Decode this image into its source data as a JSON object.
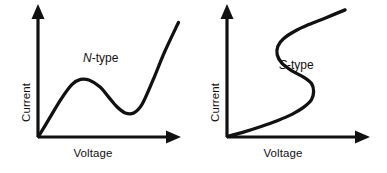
{
  "figure": {
    "background_color": "#ffffff",
    "ink_color": "#111111",
    "panel_count": 2
  },
  "chart_data": [
    {
      "type": "line",
      "title": "",
      "annotation": "N-type",
      "annotation_symbol": "N",
      "annotation_suffix": "-type",
      "xlabel": "Voltage",
      "ylabel": "Current",
      "grid": false,
      "legend": "none",
      "axis_style": "arrow-headed half-axes, no tick marks, no numeric scale",
      "xlim": [
        0,
        1
      ],
      "ylim": [
        0,
        1
      ],
      "description": "N-shaped current-voltage characteristic: current rises to a local peak, falls to a local valley (negative differential resistance region), then rises steeply. Current is a single-valued function of voltage.",
      "x": [
        0.0,
        0.08,
        0.16,
        0.24,
        0.3,
        0.36,
        0.44,
        0.5,
        0.56,
        0.62,
        0.68,
        0.74,
        0.82,
        0.9,
        1.0
      ],
      "y": [
        0.0,
        0.15,
        0.3,
        0.42,
        0.46,
        0.455,
        0.4,
        0.32,
        0.24,
        0.19,
        0.19,
        0.26,
        0.46,
        0.68,
        0.92
      ],
      "features": {
        "peak_point": {
          "x": 0.32,
          "y": 0.46
        },
        "valley_point": {
          "x": 0.65,
          "y": 0.185
        },
        "ndr_region": "between peak and valley"
      }
    },
    {
      "type": "line",
      "title": "",
      "annotation": "S-type",
      "annotation_symbol": "S",
      "annotation_suffix": "-type",
      "xlabel": "Voltage",
      "ylabel": "Current",
      "grid": false,
      "legend": "none",
      "axis_style": "arrow-headed half-axes, no tick marks, no numeric scale",
      "xlim": [
        0,
        1
      ],
      "ylim": [
        0,
        1
      ],
      "description": "S-shaped current-voltage characteristic: voltage rises to a local maximum, folds back to a local minimum (negative differential resistance region), then rises again. Voltage is a multi-valued function of current.",
      "x": [
        0.0,
        0.12,
        0.24,
        0.36,
        0.46,
        0.54,
        0.6,
        0.615,
        0.6,
        0.54,
        0.46,
        0.39,
        0.355,
        0.36,
        0.4,
        0.48,
        0.58,
        0.7,
        0.84
      ],
      "y": [
        0.0,
        0.035,
        0.075,
        0.12,
        0.165,
        0.215,
        0.275,
        0.335,
        0.395,
        0.445,
        0.49,
        0.545,
        0.61,
        0.675,
        0.73,
        0.785,
        0.835,
        0.885,
        0.945
      ],
      "features": {
        "fold_right_point": {
          "x": 0.615,
          "y": 0.335
        },
        "fold_left_point": {
          "x": 0.355,
          "y": 0.61
        },
        "ndr_region": "between the two fold points"
      }
    }
  ],
  "panels": [
    {
      "id": "n-type",
      "curve_label_symbol": "N",
      "curve_label_suffix": "-type",
      "x_axis_label": "Voltage",
      "y_axis_label": "Current"
    },
    {
      "id": "s-type",
      "curve_label_symbol": "S",
      "curve_label_suffix": "-type",
      "x_axis_label": "Voltage",
      "y_axis_label": "Current"
    }
  ]
}
